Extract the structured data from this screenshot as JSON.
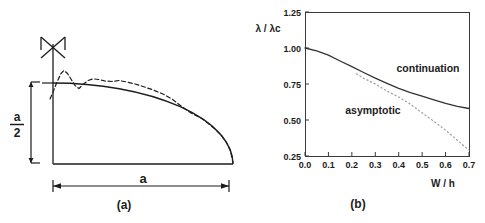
{
  "figure": {
    "panel_a": {
      "caption": "(a)",
      "width_label": "a",
      "depth_numerator": "a",
      "depth_denominator": "2"
    },
    "panel_b": {
      "caption": "(b)"
    }
  },
  "colors": {
    "ink": "#1c1c1c",
    "axis": "#3a3a3a",
    "continuation_curve": "#333333",
    "asymptotic_curve": "#9e9e9e"
  },
  "chart_data": {
    "type": "line",
    "title": "",
    "xlabel": "W / h",
    "ylabel": "λ / λc",
    "xlim": [
      0.0,
      0.7
    ],
    "ylim": [
      0.25,
      1.25
    ],
    "grid": false,
    "legend_position": "inline-annotations",
    "axis_color": "#3a3a3a",
    "x_ticks": [
      {
        "value": 0.0,
        "label": "0.0"
      },
      {
        "value": 0.1,
        "label": "0.1"
      },
      {
        "value": 0.2,
        "label": "0.2"
      },
      {
        "value": 0.3,
        "label": "0.3"
      },
      {
        "value": 0.4,
        "label": "0.4"
      },
      {
        "value": 0.5,
        "label": "0.5"
      },
      {
        "value": 0.6,
        "label": "0.6"
      },
      {
        "value": 0.7,
        "label": "0.7"
      }
    ],
    "y_ticks": [
      {
        "value": 0.25,
        "label": "0.25"
      },
      {
        "value": 0.5,
        "label": "0.50"
      },
      {
        "value": 0.75,
        "label": "0.75"
      },
      {
        "value": 1.0,
        "label": "1.00"
      },
      {
        "value": 1.25,
        "label": "1.25"
      }
    ],
    "series": [
      {
        "name": "continuation",
        "style": "solid",
        "color": "#333333",
        "annotation": {
          "x": 0.525,
          "y": 0.835
        },
        "x": [
          0.0,
          0.05,
          0.1,
          0.15,
          0.2,
          0.25,
          0.3,
          0.35,
          0.4,
          0.45,
          0.5,
          0.55,
          0.6,
          0.65,
          0.7
        ],
        "y": [
          1.0,
          0.98,
          0.95,
          0.91,
          0.87,
          0.83,
          0.79,
          0.755,
          0.72,
          0.69,
          0.665,
          0.64,
          0.615,
          0.595,
          0.58
        ]
      },
      {
        "name": "asymptotic",
        "style": "dotted",
        "color": "#9e9e9e",
        "annotation": {
          "x": 0.29,
          "y": 0.54
        },
        "x": [
          0.22,
          0.25,
          0.3,
          0.35,
          0.4,
          0.45,
          0.5,
          0.55,
          0.6,
          0.65,
          0.7
        ],
        "y": [
          0.82,
          0.79,
          0.75,
          0.7,
          0.66,
          0.61,
          0.55,
          0.49,
          0.43,
          0.36,
          0.29
        ]
      }
    ]
  }
}
